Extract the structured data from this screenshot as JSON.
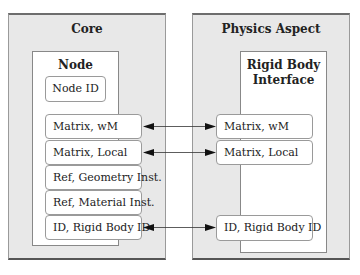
{
  "diagram": {
    "left_panel": {
      "title": "Core",
      "node": {
        "title": "Node",
        "id_field": "Node ID",
        "fields": [
          "Matrix, wM",
          "Matrix, Local",
          "Ref, Geometry Inst.",
          "Ref, Material Inst.",
          "ID, Rigid Body ID"
        ]
      }
    },
    "right_panel": {
      "title": "Physics Aspect",
      "interface": {
        "title_line1": "Rigid Body",
        "title_line2": "Interface",
        "fields": [
          "Matrix, wM",
          "Matrix, Local",
          "ID, Rigid Body ID"
        ]
      }
    },
    "connections": [
      {
        "from": "Matrix, wM",
        "to": "Matrix, wM",
        "direction": "bidirectional"
      },
      {
        "from": "Matrix, Local",
        "to": "Matrix, Local",
        "direction": "bidirectional"
      },
      {
        "from": "ID, Rigid Body ID",
        "to": "ID, Rigid Body ID",
        "direction": "bidirectional"
      }
    ],
    "colors": {
      "panel_background": "#e8e8e8",
      "box_background": "#ffffff",
      "border": "#888888",
      "arrow": "#333333"
    }
  }
}
